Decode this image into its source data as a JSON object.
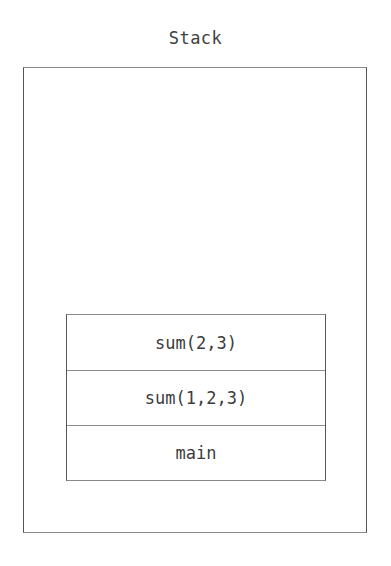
{
  "diagram": {
    "title": "Stack",
    "frames": [
      {
        "label": "sum(2,3)"
      },
      {
        "label": "sum(1,2,3)"
      },
      {
        "label": "main"
      }
    ]
  }
}
